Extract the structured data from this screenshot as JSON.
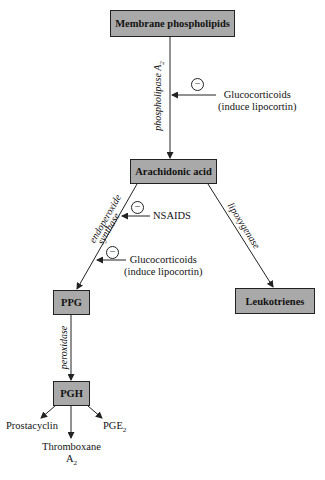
{
  "nodes": {
    "membrane": "Membrane phospholipids",
    "arachidonic": "Arachidonic acid",
    "ppg": "PPG",
    "leukotrienes": "Leukotrienes",
    "pgh": "PGH"
  },
  "enzymes": {
    "phospholipase": "phospholipase A",
    "phospholipase_sub": "2",
    "endoperoxide": "endoperoxide",
    "synthase": "synthase",
    "lipoxygenase": "lipoxygenase",
    "peroxidase": "peroxidase"
  },
  "inhibitors": {
    "symbol": "−",
    "glucocorticoids_1": "Glucocorticoids",
    "glucocorticoids_1_note": "(induce lipocortin)",
    "nsaids": "NSAIDS",
    "glucocorticoids_2": "Glucocorticoids",
    "glucocorticoids_2_note": "(induce lipocortin)"
  },
  "products": {
    "prostacyclin": "Prostacyclin",
    "thromboxane": "Thromboxane",
    "thromboxane_sub_main": "A",
    "thromboxane_sub": "2",
    "pge": "PGE",
    "pge_sub": "2"
  },
  "colors": {
    "box_fill": "#a9a9a9",
    "line": "#222222"
  }
}
